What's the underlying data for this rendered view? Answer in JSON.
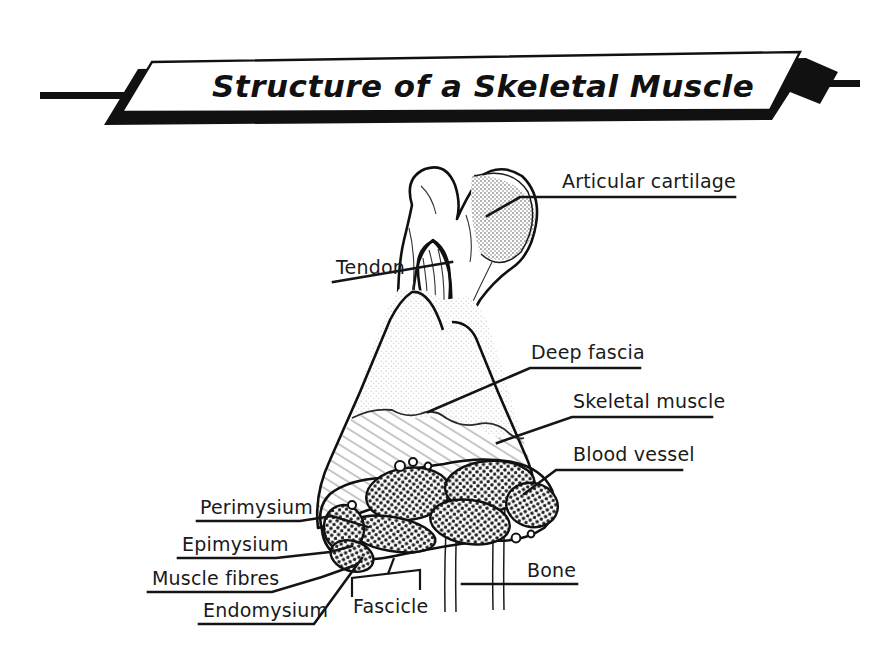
{
  "figure": {
    "title": "Structure of a Skeletal Muscle",
    "background_color": "#ffffff",
    "ink_color": "#111111"
  },
  "banner": {
    "text": "Structure of a Skeletal Muscle",
    "fill_color": "#ffffff",
    "shadow_color": "#111111",
    "border_color": "#111111",
    "left_tail": "black-bar",
    "right_tail": "black-bar"
  },
  "labels": [
    {
      "id": "articular-cartilage",
      "text": "Articular cartilage",
      "side": "right",
      "text_x": 562,
      "text_y": 188,
      "underline": {
        "x1": 557,
        "y1": 197,
        "x2": 735,
        "y2": 197
      },
      "leader": "M 557 197 L 520 197 L 489 214"
    },
    {
      "id": "tendon",
      "text": "Tendon",
      "side": "left",
      "text_x": 336,
      "text_y": 272,
      "underline": {
        "x1": 333,
        "y1": 281,
        "x2": 405,
        "y2": 281
      },
      "leader": "M 333 281 L 452 262"
    },
    {
      "id": "deep-fascia",
      "text": "Deep fascia",
      "side": "right",
      "text_x": 531,
      "text_y": 358,
      "underline": {
        "x1": 527,
        "y1": 367,
        "x2": 640,
        "y2": 367
      },
      "leader": "M 527 367 L 430 410"
    },
    {
      "id": "skeletal-muscle",
      "text": "Skeletal muscle",
      "side": "right",
      "text_x": 573,
      "text_y": 407,
      "underline": {
        "x1": 569,
        "y1": 416,
        "x2": 712,
        "y2": 416
      },
      "leader": "M 569 416 L 497 442"
    },
    {
      "id": "blood-vessel",
      "text": "Blood vessel",
      "side": "right",
      "text_x": 573,
      "text_y": 459,
      "underline": {
        "x1": 568,
        "y1": 469,
        "x2": 682,
        "y2": 469
      },
      "leader": "M 568 469 L 548 469 L 520 496"
    },
    {
      "id": "perimysium",
      "text": "Perimysium",
      "side": "left",
      "text_x": 200,
      "text_y": 514,
      "underline": {
        "x1": 197,
        "y1": 521,
        "x2": 297,
        "y2": 521
      },
      "leader": "M 297 521 L 330 516 L 365 526"
    },
    {
      "id": "epimysium",
      "text": "Epimysium",
      "side": "left",
      "text_x": 182,
      "text_y": 550,
      "underline": {
        "x1": 178,
        "y1": 557,
        "x2": 272,
        "y2": 557
      },
      "leader": "M 272 557 L 330 553 L 356 547"
    },
    {
      "id": "muscle-fibres",
      "text": "Muscle fibres",
      "side": "left",
      "text_x": 152,
      "text_y": 584,
      "underline": {
        "x1": 148,
        "y1": 591,
        "x2": 270,
        "y2": 591
      },
      "leader": "M 270 591 L 322 578 L 355 566"
    },
    {
      "id": "endomysium",
      "text": "Endomysium",
      "side": "left",
      "text_x": 203,
      "text_y": 616,
      "underline": {
        "x1": 199,
        "y1": 623,
        "x2": 313,
        "y2": 623
      },
      "leader": "M 313 623 L 360 562"
    },
    {
      "id": "fascicle",
      "text": "Fascicle",
      "side": "below",
      "text_x": 353,
      "text_y": 610,
      "bracket": "M 352 596 L 352 578 L 420 571 L 420 589",
      "leader": "M 386 574 L 392 560"
    },
    {
      "id": "bone",
      "text": "Bone",
      "side": "right",
      "text_x": 527,
      "text_y": 576,
      "underline": {
        "x1": 522,
        "y1": 583,
        "x2": 577,
        "y2": 583
      },
      "leader": "M 522 583 L 462 583"
    }
  ],
  "structures": [
    {
      "id": "bone-head",
      "name": "proximal bone epiphysis",
      "fill": "#ffffff"
    },
    {
      "id": "articular-cartilage-cap",
      "name": "articular cartilage",
      "fill": "#b9b9b9",
      "pattern": "stipple"
    },
    {
      "id": "tendon",
      "name": "tendon fibres",
      "fill": "#ffffff"
    },
    {
      "id": "deep-fascia-layer",
      "name": "deep fascia",
      "fill": "#ededed",
      "pattern": "stipple"
    },
    {
      "id": "skeletal-muscle-belly",
      "name": "skeletal muscle",
      "fill": "#e2e2e2",
      "pattern": "diagonal-hatch"
    },
    {
      "id": "fascicle-cluster",
      "name": "fascicles in cross-section",
      "fill": "#d9d9d9",
      "pattern": "dense-dots"
    },
    {
      "id": "bone-shaft",
      "name": "bone diaphysis",
      "fill": "#ffffff"
    },
    {
      "id": "blood-vessels",
      "name": "blood vessels",
      "fill": "#ffffff"
    }
  ]
}
